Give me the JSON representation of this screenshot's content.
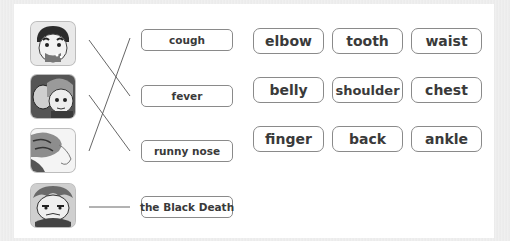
{
  "exercise": {
    "pictures": [
      {
        "id": "picture-1",
        "icon": "cartoon-man-coughing"
      },
      {
        "id": "picture-2",
        "icon": "cartoon-people-fever"
      },
      {
        "id": "picture-3",
        "icon": "cartoon-runny-nose"
      },
      {
        "id": "picture-4",
        "icon": "cartoon-sick-face"
      }
    ],
    "diseases": [
      "cough",
      "fever",
      "runny nose",
      "the Black Death"
    ],
    "matches": [
      {
        "picture": 1,
        "disease": "fever"
      },
      {
        "picture": 2,
        "disease": "runny nose"
      },
      {
        "picture": 3,
        "disease": "cough"
      },
      {
        "picture": 4,
        "disease": "the Black Death"
      }
    ],
    "body_parts": [
      [
        "elbow",
        "tooth",
        "waist"
      ],
      [
        "belly",
        "shoulder",
        "chest"
      ],
      [
        "finger",
        "back",
        "ankle"
      ]
    ]
  },
  "colors": {
    "line": "#555555",
    "box_border": "#8a8a8a",
    "text": "#3a3a3a"
  }
}
